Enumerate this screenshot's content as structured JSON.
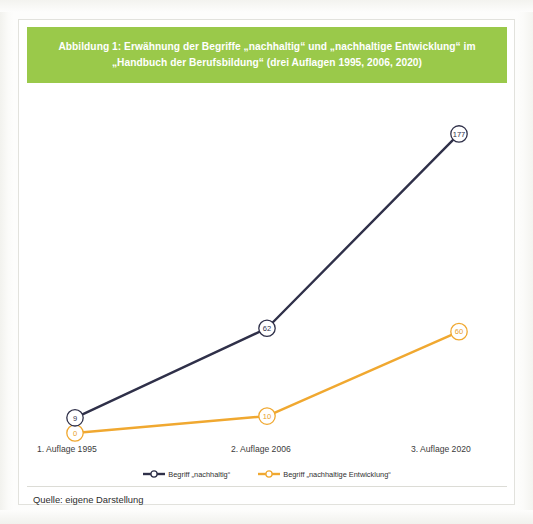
{
  "figure": {
    "title": "Abbildung 1: Erwähnung der Begriffe „nachhaltig“ und „nachhaltige Entwicklung“ im „Handbuch der Berufsbildung“ (drei Auflagen 1995, 2006, 2020)",
    "source": "Quelle: eigene Darstellung",
    "banner_color": "#9ac94a"
  },
  "chart_data": {
    "type": "line",
    "title": "Abbildung 1: Erwähnung der Begriffe „nachhaltig“ und „nachhaltige Entwicklung“ im „Handbuch der Berufsbildung“ (drei Auflagen 1995, 2006, 2020)",
    "xlabel": "",
    "ylabel": "",
    "categories": [
      "1. Auflage 1995",
      "2. Auflage 2006",
      "3. Auflage 2020"
    ],
    "series": [
      {
        "name": "Begriff „nachhaltig“",
        "color": "#2f3049",
        "values": [
          9,
          62,
          177
        ],
        "labels": [
          "9",
          "62",
          "177"
        ]
      },
      {
        "name": "Begriff „nachhaltige Entwicklung“",
        "color": "#f0a830",
        "values": [
          0,
          10,
          60
        ],
        "labels": [
          "0",
          "10",
          "60"
        ]
      }
    ],
    "ylim": [
      0,
      190
    ],
    "grid": false,
    "legend_position": "bottom",
    "markers": "circle-with-value-label"
  }
}
